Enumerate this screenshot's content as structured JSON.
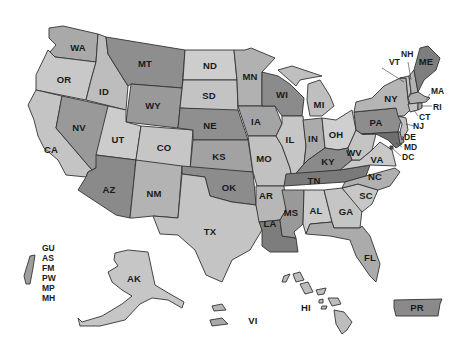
{
  "map": {
    "title": "United States and Territories",
    "colors": {
      "light": "#cfcfcf",
      "mid_light": "#b8b8b8",
      "mid": "#a4a4a4",
      "dark": "#8c8c8c",
      "darker": "#797979",
      "border": "#333333",
      "background": "#ffffff"
    },
    "states": [
      {
        "id": "WA",
        "label": "WA"
      },
      {
        "id": "OR",
        "label": "OR"
      },
      {
        "id": "CA",
        "label": "CA"
      },
      {
        "id": "ID",
        "label": "ID"
      },
      {
        "id": "NV",
        "label": "NV"
      },
      {
        "id": "MT",
        "label": "MT"
      },
      {
        "id": "WY",
        "label": "WY"
      },
      {
        "id": "UT",
        "label": "UT"
      },
      {
        "id": "AZ",
        "label": "AZ"
      },
      {
        "id": "CO",
        "label": "CO"
      },
      {
        "id": "NM",
        "label": "NM"
      },
      {
        "id": "ND",
        "label": "ND"
      },
      {
        "id": "SD",
        "label": "SD"
      },
      {
        "id": "NE",
        "label": "NE"
      },
      {
        "id": "KS",
        "label": "KS"
      },
      {
        "id": "OK",
        "label": "OK"
      },
      {
        "id": "TX",
        "label": "TX"
      },
      {
        "id": "MN",
        "label": "MN"
      },
      {
        "id": "IA",
        "label": "IA"
      },
      {
        "id": "MO",
        "label": "MO"
      },
      {
        "id": "AR",
        "label": "AR"
      },
      {
        "id": "LA",
        "label": "LA"
      },
      {
        "id": "WI",
        "label": "WI"
      },
      {
        "id": "IL",
        "label": "IL"
      },
      {
        "id": "MI",
        "label": "MI"
      },
      {
        "id": "IN",
        "label": "IN"
      },
      {
        "id": "OH",
        "label": "OH"
      },
      {
        "id": "KY",
        "label": "KY"
      },
      {
        "id": "TN",
        "label": "TN"
      },
      {
        "id": "MS",
        "label": "MS"
      },
      {
        "id": "AL",
        "label": "AL"
      },
      {
        "id": "GA",
        "label": "GA"
      },
      {
        "id": "FL",
        "label": "FL"
      },
      {
        "id": "SC",
        "label": "SC"
      },
      {
        "id": "NC",
        "label": "NC"
      },
      {
        "id": "VA",
        "label": "VA"
      },
      {
        "id": "WV",
        "label": "WV"
      },
      {
        "id": "PA",
        "label": "PA"
      },
      {
        "id": "NY",
        "label": "NY"
      },
      {
        "id": "VT",
        "label": "VT"
      },
      {
        "id": "NH",
        "label": "NH"
      },
      {
        "id": "ME",
        "label": "ME"
      },
      {
        "id": "MA",
        "label": "MA"
      },
      {
        "id": "RI",
        "label": "RI"
      },
      {
        "id": "CT",
        "label": "CT"
      },
      {
        "id": "NJ",
        "label": "NJ"
      },
      {
        "id": "DE",
        "label": "DE"
      },
      {
        "id": "MD",
        "label": "MD"
      },
      {
        "id": "DC",
        "label": "DC"
      },
      {
        "id": "AK",
        "label": "AK"
      },
      {
        "id": "HI",
        "label": "HI"
      }
    ],
    "territories": {
      "PR": "PR",
      "VI": "VI",
      "pacific_list": [
        "GU",
        "AS",
        "FM",
        "PW",
        "MP",
        "MH"
      ]
    }
  }
}
